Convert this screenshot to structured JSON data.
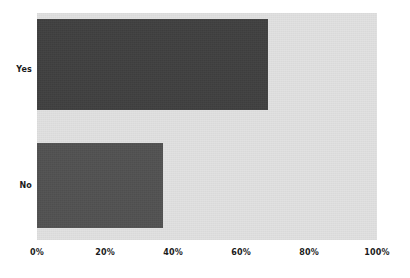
{
  "chart_data": {
    "type": "bar",
    "orientation": "horizontal",
    "title": "",
    "subtitle": "",
    "xlabel": "",
    "ylabel": "",
    "categories": [
      "Yes",
      "No"
    ],
    "values": [
      68,
      37
    ],
    "value_labels": [
      "68%",
      "37%"
    ],
    "xlim": [
      0,
      100
    ],
    "xticks": [
      0,
      20,
      40,
      60,
      80,
      100
    ],
    "xticklabels": [
      "0%",
      "20%",
      "40%",
      "60%",
      "80%",
      "100%"
    ],
    "grid": false,
    "legend": null,
    "legend_position": "none",
    "annotations": [],
    "series": [
      {
        "name": "",
        "categories": [
          "Yes",
          "No"
        ],
        "values": [
          68,
          37
        ]
      }
    ]
  },
  "style": {
    "page_background": "#ffffff",
    "plot_background": "#e1e1e1",
    "bar_color_yes": "#3b3b3b",
    "bar_color_no": "#4e4e4e",
    "tick_text_color": "#1b1b1b"
  },
  "axis": {
    "x_ticks": [
      {
        "label": "0%",
        "value": 0,
        "x_px": 37
      },
      {
        "label": "20%",
        "value": 20,
        "x_px": 105
      },
      {
        "label": "40%",
        "value": 40,
        "x_px": 173
      },
      {
        "label": "60%",
        "value": 60,
        "x_px": 241
      },
      {
        "label": "80%",
        "value": 80,
        "x_px": 309
      },
      {
        "label": "100%",
        "value": 100,
        "x_px": 377
      }
    ],
    "y_categories": [
      {
        "label": "Yes"
      },
      {
        "label": "No"
      }
    ]
  }
}
